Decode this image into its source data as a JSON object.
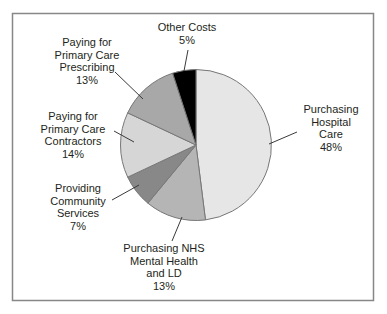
{
  "chart_data": {
    "type": "pie",
    "title": "",
    "direction": "clockwise",
    "start_angle_deg": 0,
    "total": 100,
    "stroke_color": "#777777",
    "text_color": "#231f20",
    "border_color": "#878787",
    "slices": [
      {
        "id": "purchasing-hospital-care",
        "label": "Purchasing\nHospital Care",
        "pct_label": "48%",
        "value": 48,
        "color": "#e6e6e6"
      },
      {
        "id": "purchasing-nhs-mental-health",
        "label": "Purchasing NHS\nMental Health\nand LD",
        "pct_label": "13%",
        "value": 13,
        "color": "#b5b5b5"
      },
      {
        "id": "providing-community-services",
        "label": "Providing\nCommunity\nServices",
        "pct_label": "7%",
        "value": 7,
        "color": "#888888"
      },
      {
        "id": "paying-primary-care-contractors",
        "label": "Paying for\nPrimary Care\nContractors",
        "pct_label": "14%",
        "value": 14,
        "color": "#d6d6d6"
      },
      {
        "id": "paying-primary-care-prescribing",
        "label": "Paying for\nPrimary Care\nPrescribing",
        "pct_label": "13%",
        "value": 13,
        "color": "#a8a8a8"
      },
      {
        "id": "other-costs",
        "label": "Other Costs",
        "pct_label": "5%",
        "value": 5,
        "color": "#000000"
      }
    ]
  }
}
